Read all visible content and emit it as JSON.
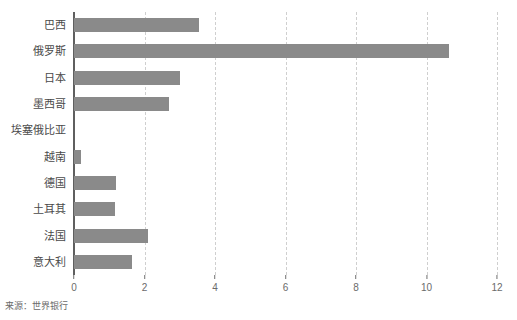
{
  "chart_title_ghost": "",
  "source_note": "来源：世界银行",
  "colors": {
    "bar": "#8a8a8a",
    "axis": "#5f5f5f",
    "grid": "#cfcfcf",
    "label": "#4a4a4a",
    "tick": "#6b6b6b"
  },
  "chart_data": {
    "type": "bar",
    "orientation": "horizontal",
    "title": "",
    "xlabel": "",
    "ylabel": "",
    "xlim": [
      0,
      12
    ],
    "ylim": null,
    "grid": "vertical-dashed",
    "legend": "none",
    "xticks": [
      "0",
      "2",
      "4",
      "6",
      "8",
      "10",
      "12"
    ],
    "xtick_values": [
      0,
      2,
      4,
      6,
      8,
      10,
      12
    ],
    "categories": [
      "巴西",
      "俄罗斯",
      "日本",
      "墨西哥",
      "埃塞俄比亚",
      "越南",
      "德国",
      "土耳其",
      "法国",
      "意大利"
    ],
    "values": [
      3.55,
      10.65,
      3.0,
      2.7,
      0,
      0.2,
      1.2,
      1.15,
      2.1,
      1.65
    ],
    "series": [
      {
        "name": "",
        "values": [
          3.55,
          10.65,
          3.0,
          2.7,
          0,
          0.2,
          1.2,
          1.15,
          2.1,
          1.65
        ]
      }
    ],
    "annotations": []
  }
}
